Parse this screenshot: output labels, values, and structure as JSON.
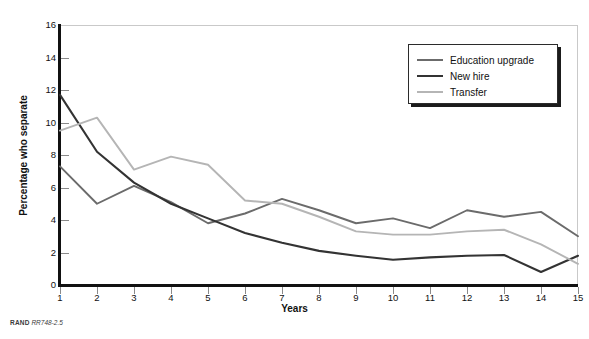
{
  "footer": {
    "source_prefix": "RAND",
    "source_code": "RR748-2.5"
  },
  "legend": {
    "position": "top-right",
    "entries": [
      {
        "label": "Education upgrade",
        "color": "#6b6b6b"
      },
      {
        "label": "New hire",
        "color": "#333333"
      },
      {
        "label": "Transfer",
        "color": "#b5b5b5"
      }
    ]
  },
  "chart_data": {
    "type": "line",
    "title": "",
    "xlabel": "Years",
    "ylabel": "Percentage who separate",
    "x": [
      1,
      2,
      3,
      4,
      5,
      6,
      7,
      8,
      9,
      10,
      11,
      12,
      13,
      14,
      15
    ],
    "xlim": [
      1,
      15
    ],
    "ylim": [
      0,
      16
    ],
    "xticks": [
      "1",
      "2",
      "3",
      "4",
      "5",
      "6",
      "7",
      "8",
      "9",
      "10",
      "11",
      "12",
      "13",
      "14",
      "15"
    ],
    "yticks": [
      "0",
      "2",
      "4",
      "6",
      "8",
      "10",
      "12",
      "14",
      "16"
    ],
    "grid": false,
    "legend_position": "top-right",
    "series": [
      {
        "name": "Education upgrade",
        "color": "#6b6b6b",
        "values": [
          7.3,
          5.0,
          6.1,
          5.1,
          3.8,
          4.4,
          5.3,
          4.6,
          3.8,
          4.1,
          3.5,
          4.6,
          4.2,
          4.5,
          3.0
        ]
      },
      {
        "name": "New hire",
        "color": "#333333",
        "values": [
          11.7,
          8.2,
          6.3,
          5.0,
          4.1,
          3.2,
          2.6,
          2.1,
          1.8,
          1.55,
          1.7,
          1.8,
          1.85,
          0.8,
          1.8
        ]
      },
      {
        "name": "Transfer",
        "color": "#b5b5b5",
        "values": [
          9.5,
          10.3,
          7.1,
          7.9,
          7.4,
          5.2,
          5.0,
          4.2,
          3.3,
          3.1,
          3.1,
          3.3,
          3.4,
          2.5,
          1.3
        ]
      }
    ]
  }
}
